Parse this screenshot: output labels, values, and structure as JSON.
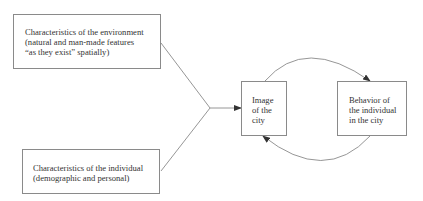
{
  "diagram": {
    "nodes": {
      "environment": {
        "lines": [
          "Characteristics of the environment",
          "(natural and man-made features",
          "“as they exist” spatially)"
        ]
      },
      "individual": {
        "lines": [
          "Characteristics of the individual",
          "(demographic and personal)"
        ]
      },
      "image": {
        "lines": [
          "Image",
          "of the",
          "city"
        ]
      },
      "behavior": {
        "lines": [
          "Behavior of",
          "the individual",
          "in the city"
        ]
      }
    },
    "edges": [
      {
        "from": "environment",
        "to": "image",
        "type": "converging-line"
      },
      {
        "from": "individual",
        "to": "image",
        "type": "converging-line"
      },
      {
        "from": "image",
        "to": "behavior",
        "type": "curved-arrow-top"
      },
      {
        "from": "behavior",
        "to": "image",
        "type": "curved-arrow-bottom"
      }
    ],
    "colors": {
      "line": "#8a8a8a",
      "text": "#333333",
      "background": "#ffffff"
    }
  }
}
